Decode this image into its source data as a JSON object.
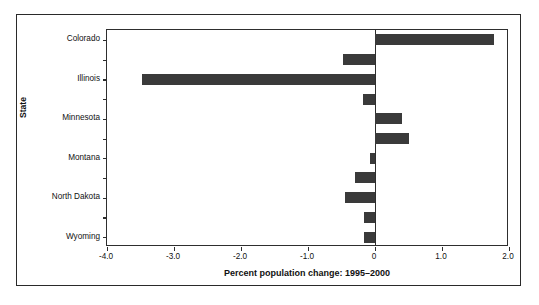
{
  "chart_data": {
    "type": "bar",
    "orientation": "horizontal",
    "title": "",
    "xlabel": "Percent population change: 1995–2000",
    "ylabel": "State",
    "xlim": [
      -4.0,
      2.0
    ],
    "xticks": [
      -4.0,
      -3.0,
      -2.0,
      -1.0,
      0,
      1.0,
      2.0
    ],
    "xticklabels": [
      "-4.0",
      "-3.0",
      "-2.0",
      "-1.0",
      "0",
      "1.0",
      "2.0"
    ],
    "grid": false,
    "legend": false,
    "bar_color": "#3a3a3a",
    "axis_color": "#2e2e2e",
    "categories": [
      "Colorado",
      "",
      "Illinois",
      "",
      "Minnesota",
      "",
      "Montana",
      "",
      "North Dakota",
      "",
      "Wyoming"
    ],
    "values": [
      1.78,
      -0.48,
      -3.48,
      -0.18,
      0.4,
      0.5,
      -0.08,
      -0.3,
      -0.45,
      -0.16,
      -0.17
    ],
    "yticklabels": [
      "Colorado",
      "Illinois",
      "Minnesota",
      "Montana",
      "North Dakota",
      "Wyoming"
    ],
    "ytick_rows": [
      0,
      2,
      4,
      6,
      8,
      10
    ]
  }
}
